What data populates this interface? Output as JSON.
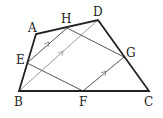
{
  "diagram": {
    "type": "geometry",
    "points": {
      "A": {
        "x": 36,
        "y": 34,
        "label": "A",
        "lx": 28,
        "ly": 32
      },
      "H": {
        "x": 67,
        "y": 28,
        "label": "H",
        "lx": 61,
        "ly": 23
      },
      "D": {
        "x": 98,
        "y": 20,
        "label": "D",
        "lx": 93,
        "ly": 16
      },
      "G": {
        "x": 124,
        "y": 57,
        "label": "G",
        "lx": 126,
        "ly": 57
      },
      "C": {
        "x": 149,
        "y": 91,
        "label": "C",
        "lx": 144,
        "ly": 106
      },
      "F": {
        "x": 83,
        "y": 91,
        "label": "F",
        "lx": 79,
        "ly": 106
      },
      "B": {
        "x": 19,
        "y": 91,
        "label": "B",
        "lx": 14,
        "ly": 106
      },
      "E": {
        "x": 27,
        "y": 63,
        "label": "E",
        "lx": 16,
        "ly": 64
      }
    },
    "quadrilateral": [
      "A",
      "B",
      "C",
      "D"
    ],
    "inner_parallelogram": [
      "E",
      "F",
      "G",
      "H"
    ],
    "diagonal": [
      "B",
      "D"
    ],
    "parallel_marks": [
      "EH",
      "BD",
      "FG"
    ],
    "colors": {
      "outline": "#222222",
      "inner": "#555555",
      "diagonal": "#999999"
    }
  }
}
